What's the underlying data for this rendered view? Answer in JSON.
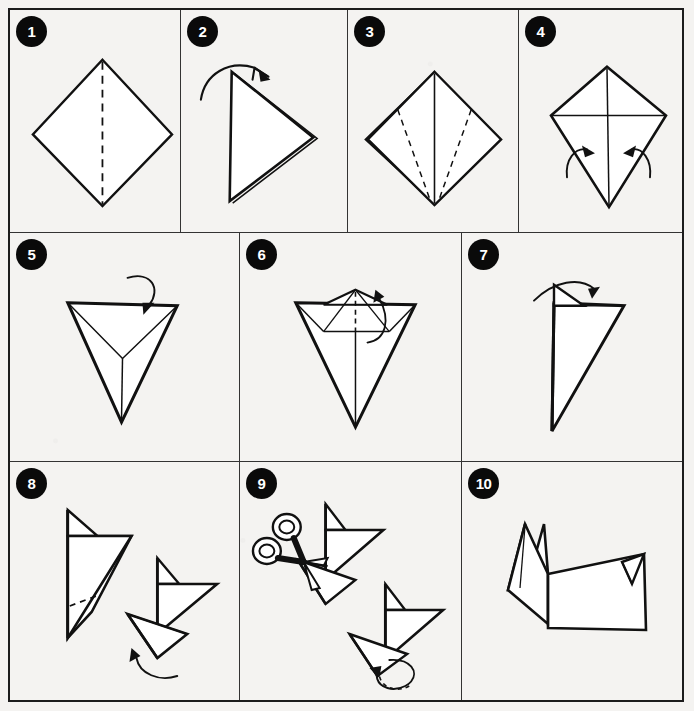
{
  "document": {
    "title": "Origami fold instructions",
    "subject": "Paper folding diagram sequence",
    "ink_color": "#111111",
    "paper_color": "#f4f3f1",
    "badge_color": "#0a0a0a",
    "badge_text_color": "#ffffff",
    "rows": 3,
    "columns": [
      4,
      3,
      3
    ]
  },
  "steps": [
    {
      "number": "1",
      "name": "square-diamond-with-center-crease",
      "description": "Square sheet rotated as a diamond with a vertical dashed valley crease from top vertex to bottom vertex.",
      "shapes": [
        "diamond-outline",
        "vertical-dashed-crease"
      ],
      "arrows": []
    },
    {
      "number": "2",
      "name": "folded-triangle-right",
      "description": "Diamond folded in half along the vertical crease forming a triangle pointing right with a doubled layered edge. Curved arrow over the top indicates unfolding.",
      "shapes": [
        "triangle-right",
        "layer-edge"
      ],
      "arrows": [
        "curved-arrow-over-top"
      ]
    },
    {
      "number": "3",
      "name": "diamond-with-two-diagonal-creases",
      "description": "Unfolded diamond showing solid vertical center line plus two dashed diagonal crease lines running from the upper side edges down to the bottom vertex.",
      "shapes": [
        "diamond-outline",
        "vertical-center-line",
        "left-dashed-crease",
        "right-dashed-crease"
      ],
      "arrows": []
    },
    {
      "number": "4",
      "name": "kite-fold-sides-inward",
      "description": "Kite shape with a horizontal crease across the widest points and a vertical center line. Two curved arrows point inward at the lower slanted edges to fold the sides in.",
      "shapes": [
        "kite-outline",
        "horizontal-crease",
        "vertical-center-line"
      ],
      "arrows": [
        "curved-arrow-left-inward",
        "curved-arrow-right-inward"
      ]
    },
    {
      "number": "5",
      "name": "inverted-triangle-flip",
      "description": "Inverted triangle with internal Y shaped fold lines meeting at a center point. A curved arrow loops over the top edge indicating a flip or fold down.",
      "shapes": [
        "inverted-triangle",
        "y-fold-lines"
      ],
      "arrows": [
        "curved-arrow-down-over-top"
      ]
    },
    {
      "number": "6",
      "name": "inverted-triangle-with-peak",
      "description": "Inverted triangle with a small peak folded up at the top, a horizontal band across, a dashed vertical center crease, and a curved arrow at the right of the peak.",
      "shapes": [
        "inverted-triangle",
        "top-peak",
        "horizontal-band",
        "dashed-center-crease"
      ],
      "arrows": [
        "curved-arrow-peak-right"
      ]
    },
    {
      "number": "7",
      "name": "narrow-triangle-with-flap",
      "description": "Model folded in half into a narrow triangle with a small pointed flap at the top. A curved arrow to the right indicates folding the flap over.",
      "shapes": [
        "narrow-triangle",
        "top-flap",
        "horizontal-crease"
      ],
      "arrows": [
        "curved-arrow-flap-right"
      ]
    },
    {
      "number": "8",
      "name": "head-shape-and-leg-fold",
      "description": "Two figures. Left figure shows the head shape with a dashed diagonal crease near the lower edge. Right figure shows the lower point folded out into a leg with a curved arrow sweeping upward.",
      "shapes": [
        "head-shape-left",
        "dashed-crease",
        "head-shape-right",
        "folded-leg"
      ],
      "arrows": [
        "curved-arrow-up-left"
      ]
    },
    {
      "number": "9",
      "name": "cut-with-scissors-and-rotate",
      "description": "Two figures. Upper figure is being cut with a pair of open scissors at the neck region. Lower figure shows a circular looping arrow indicating turning the model over.",
      "shapes": [
        "scissors",
        "figure-upper",
        "figure-lower"
      ],
      "arrows": [
        "circular-rotate-arrow"
      ]
    },
    {
      "number": "10",
      "name": "finished-fox-model",
      "description": "Completed origami model: an animal with two pointed ears, a body and a pointed tail at the right.",
      "shapes": [
        "finished-animal"
      ],
      "arrows": []
    }
  ]
}
